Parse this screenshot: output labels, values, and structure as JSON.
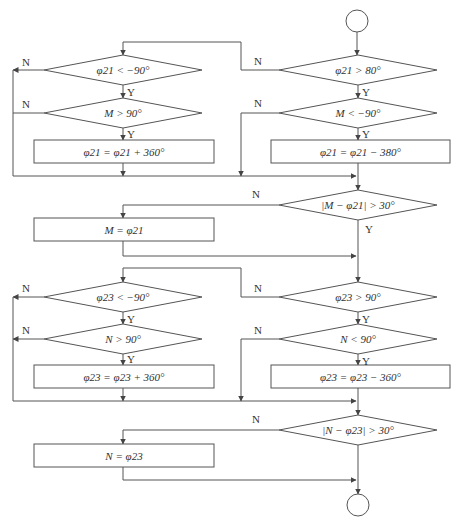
{
  "colors": {
    "line": "#555555",
    "text": "#333333",
    "background": "#ffffff"
  },
  "terminals": [
    {
      "id": "start",
      "cx": 357,
      "cy": 21,
      "r": 11
    },
    {
      "id": "end",
      "cx": 358,
      "cy": 505,
      "r": 11
    }
  ],
  "decisions": [
    {
      "id": "d1",
      "label": "φ21 > 80°",
      "cx": 358,
      "cy": 70,
      "hw": 79,
      "hh": 15
    },
    {
      "id": "d2",
      "label": "M < −90°",
      "cx": 358,
      "cy": 113,
      "hw": 79,
      "hh": 15
    },
    {
      "id": "d3",
      "label": "φ21 < −90°",
      "cx": 123,
      "cy": 70,
      "hw": 79,
      "hh": 15
    },
    {
      "id": "d4",
      "label": "M > 90°",
      "cx": 123,
      "cy": 113,
      "hw": 79,
      "hh": 15
    },
    {
      "id": "d5",
      "label": "|M − φ21| > 30°",
      "cx": 358,
      "cy": 205,
      "hw": 79,
      "hh": 15
    },
    {
      "id": "d6",
      "label": "φ23 > 90°",
      "cx": 358,
      "cy": 297,
      "hw": 79,
      "hh": 15
    },
    {
      "id": "d7",
      "label": "N < 90°",
      "cx": 358,
      "cy": 339,
      "hw": 79,
      "hh": 15
    },
    {
      "id": "d8",
      "label": "φ23 < −90°",
      "cx": 123,
      "cy": 297,
      "hw": 79,
      "hh": 15
    },
    {
      "id": "d9",
      "label": "N > 90°",
      "cx": 123,
      "cy": 339,
      "hw": 79,
      "hh": 15
    },
    {
      "id": "d10",
      "label": "|N − φ23| > 30°",
      "cx": 358,
      "cy": 430,
      "hw": 79,
      "hh": 15
    }
  ],
  "processes": [
    {
      "id": "p1",
      "label": "φ21 = φ21 + 360°",
      "x": 34,
      "y": 140,
      "w": 180,
      "h": 23
    },
    {
      "id": "p2",
      "label": "φ21 = φ21 − 380°",
      "x": 271,
      "y": 140,
      "w": 179,
      "h": 23
    },
    {
      "id": "p3",
      "label": "M = φ21",
      "x": 34,
      "y": 218,
      "w": 180,
      "h": 23
    },
    {
      "id": "p4",
      "label": "φ23 = φ23 + 360°",
      "x": 34,
      "y": 365,
      "w": 180,
      "h": 23
    },
    {
      "id": "p5",
      "label": "φ23 = φ23 − 360°",
      "x": 271,
      "y": 365,
      "w": 179,
      "h": 23
    },
    {
      "id": "p6",
      "label": "N = φ23",
      "x": 34,
      "y": 444,
      "w": 180,
      "h": 23
    }
  ],
  "branch_labels": [
    {
      "text": "N",
      "x": 258,
      "y": 65
    },
    {
      "text": "Y",
      "x": 366,
      "y": 96
    },
    {
      "text": "N",
      "x": 258,
      "y": 107
    },
    {
      "text": "Y",
      "x": 366,
      "y": 138
    },
    {
      "text": "N",
      "x": 26,
      "y": 66
    },
    {
      "text": "Y",
      "x": 131,
      "y": 96
    },
    {
      "text": "N",
      "x": 26,
      "y": 108
    },
    {
      "text": "Y",
      "x": 131,
      "y": 138
    },
    {
      "text": "N",
      "x": 256,
      "y": 198
    },
    {
      "text": "Y",
      "x": 369,
      "y": 233
    },
    {
      "text": "N",
      "x": 258,
      "y": 292
    },
    {
      "text": "Y",
      "x": 366,
      "y": 323
    },
    {
      "text": "N",
      "x": 258,
      "y": 334
    },
    {
      "text": "Y",
      "x": 366,
      "y": 365
    },
    {
      "text": "N",
      "x": 26,
      "y": 292
    },
    {
      "text": "Y",
      "x": 131,
      "y": 323
    },
    {
      "text": "N",
      "x": 26,
      "y": 334
    },
    {
      "text": "Y",
      "x": 131,
      "y": 363
    },
    {
      "text": "N",
      "x": 256,
      "y": 423
    }
  ],
  "connectors": [
    {
      "points": [
        [
          357,
          32
        ],
        [
          357,
          55
        ]
      ],
      "arrow": true
    },
    {
      "points": [
        [
          358,
          85
        ],
        [
          358,
          98
        ]
      ],
      "arrow": true
    },
    {
      "points": [
        [
          358,
          128
        ],
        [
          358,
          140
        ]
      ],
      "arrow": true
    },
    {
      "points": [
        [
          358,
          163
        ],
        [
          358,
          190
        ]
      ],
      "arrow": true
    },
    {
      "points": [
        [
          279,
          70
        ],
        [
          241,
          70
        ],
        [
          241,
          42
        ],
        [
          123,
          42
        ],
        [
          123,
          55
        ]
      ],
      "arrow": true
    },
    {
      "points": [
        [
          123,
          85
        ],
        [
          123,
          98
        ]
      ],
      "arrow": true
    },
    {
      "points": [
        [
          123,
          128
        ],
        [
          123,
          140
        ]
      ],
      "arrow": true
    },
    {
      "points": [
        [
          123,
          163
        ],
        [
          123,
          176
        ]
      ],
      "arrow": true
    },
    {
      "points": [
        [
          44,
          70
        ],
        [
          13,
          70
        ]
      ],
      "arrow": true
    },
    {
      "points": [
        [
          44,
          113
        ],
        [
          13,
          113
        ]
      ],
      "arrow": false
    },
    {
      "points": [
        [
          13,
          70
        ],
        [
          13,
          176
        ],
        [
          356,
          176
        ]
      ],
      "arrow": true
    },
    {
      "points": [
        [
          279,
          113
        ],
        [
          241,
          113
        ],
        [
          241,
          176
        ]
      ],
      "arrow": true
    },
    {
      "points": [
        [
          279,
          205
        ],
        [
          123,
          205
        ],
        [
          123,
          218
        ]
      ],
      "arrow": true
    },
    {
      "points": [
        [
          123,
          241
        ],
        [
          123,
          256
        ],
        [
          356,
          256
        ]
      ],
      "arrow": true
    },
    {
      "points": [
        [
          358,
          220
        ],
        [
          358,
          282
        ]
      ],
      "arrow": true
    },
    {
      "points": [
        [
          358,
          312
        ],
        [
          358,
          324
        ]
      ],
      "arrow": true
    },
    {
      "points": [
        [
          358,
          354
        ],
        [
          358,
          365
        ]
      ],
      "arrow": true
    },
    {
      "points": [
        [
          358,
          388
        ],
        [
          358,
          415
        ]
      ],
      "arrow": true
    },
    {
      "points": [
        [
          279,
          297
        ],
        [
          241,
          297
        ],
        [
          241,
          268
        ],
        [
          123,
          268
        ],
        [
          123,
          282
        ]
      ],
      "arrow": true
    },
    {
      "points": [
        [
          123,
          312
        ],
        [
          123,
          324
        ]
      ],
      "arrow": true
    },
    {
      "points": [
        [
          123,
          354
        ],
        [
          123,
          365
        ]
      ],
      "arrow": true
    },
    {
      "points": [
        [
          123,
          388
        ],
        [
          123,
          401
        ]
      ],
      "arrow": true
    },
    {
      "points": [
        [
          44,
          297
        ],
        [
          13,
          297
        ]
      ],
      "arrow": true
    },
    {
      "points": [
        [
          44,
          339
        ],
        [
          13,
          339
        ]
      ],
      "arrow": true
    },
    {
      "points": [
        [
          13,
          297
        ],
        [
          13,
          401
        ],
        [
          356,
          401
        ]
      ],
      "arrow": true
    },
    {
      "points": [
        [
          279,
          339
        ],
        [
          241,
          339
        ],
        [
          241,
          401
        ]
      ],
      "arrow": true
    },
    {
      "points": [
        [
          279,
          430
        ],
        [
          123,
          430
        ],
        [
          123,
          444
        ]
      ],
      "arrow": true
    },
    {
      "points": [
        [
          123,
          467
        ],
        [
          123,
          480
        ],
        [
          356,
          480
        ]
      ],
      "arrow": true
    },
    {
      "points": [
        [
          358,
          445
        ],
        [
          358,
          494
        ]
      ],
      "arrow": true
    }
  ]
}
